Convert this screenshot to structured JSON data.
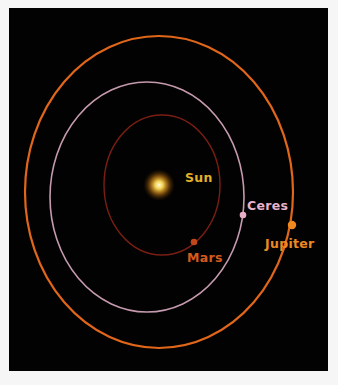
{
  "diagram": {
    "background": "#020202",
    "sun": {
      "label": "Sun",
      "color": "#e0b02a",
      "cx": 159,
      "cy": 185
    },
    "orbits": [
      {
        "name": "Mars",
        "label": "Mars",
        "color": "#7a1e14",
        "label_color": "#d45a1e",
        "cx": 162,
        "cy": 185,
        "rx": 58,
        "ry": 70,
        "dot": [
          194,
          242
        ]
      },
      {
        "name": "Ceres",
        "label": "Ceres",
        "color": "#c59aae",
        "label_color": "#e8b4cc",
        "cx": 147,
        "cy": 197,
        "rx": 97,
        "ry": 115,
        "dot": [
          243,
          215
        ]
      },
      {
        "name": "Jupiter",
        "label": "Jupiter",
        "color": "#e0661a",
        "label_color": "#ec8a22",
        "cx": 159,
        "cy": 192,
        "rx": 134,
        "ry": 156,
        "dot": [
          292,
          225
        ]
      }
    ]
  }
}
